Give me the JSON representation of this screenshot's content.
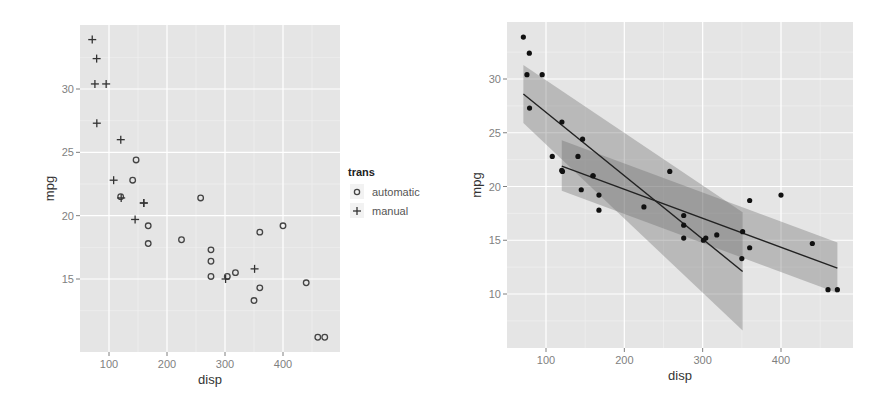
{
  "chart_data": [
    {
      "type": "scatter",
      "title": "",
      "xlabel": "disp",
      "ylabel": "mpg",
      "xlim": [
        52,
        490
      ],
      "ylim": [
        9.2,
        35.0
      ],
      "x_ticks": [
        100,
        200,
        300,
        400
      ],
      "y_ticks": [
        15,
        20,
        25,
        30
      ],
      "grid": true,
      "legend": {
        "title": "trans",
        "position": "right",
        "entries": [
          {
            "label": "automatic",
            "shape": "circle-open"
          },
          {
            "label": "manual",
            "shape": "plus"
          }
        ]
      },
      "series": [
        {
          "name": "automatic",
          "shape": "circle-open",
          "points": [
            [
              258,
              21.4
            ],
            [
              360,
              18.7
            ],
            [
              225,
              18.1
            ],
            [
              360,
              14.3
            ],
            [
              146.7,
              24.4
            ],
            [
              140.8,
              22.8
            ],
            [
              167.6,
              19.2
            ],
            [
              167.6,
              17.8
            ],
            [
              275.8,
              16.4
            ],
            [
              275.8,
              17.3
            ],
            [
              275.8,
              15.2
            ],
            [
              472,
              10.4
            ],
            [
              460,
              10.4
            ],
            [
              440,
              14.7
            ],
            [
              120.1,
              21.5
            ],
            [
              318,
              15.5
            ],
            [
              304,
              15.2
            ],
            [
              350,
              13.3
            ],
            [
              400,
              19.2
            ]
          ]
        },
        {
          "name": "manual",
          "shape": "plus",
          "points": [
            [
              160,
              21.0
            ],
            [
              160,
              21.0
            ],
            [
              108,
              22.8
            ],
            [
              78.7,
              32.4
            ],
            [
              75.7,
              30.4
            ],
            [
              71.1,
              33.9
            ],
            [
              79,
              27.3
            ],
            [
              120.3,
              26.0
            ],
            [
              95.1,
              30.4
            ],
            [
              351,
              15.8
            ],
            [
              145,
              19.7
            ],
            [
              301,
              15.0
            ],
            [
              121,
              21.4
            ]
          ]
        }
      ]
    },
    {
      "type": "scatter",
      "title": "",
      "xlabel": "disp",
      "ylabel": "mpg",
      "xlim": [
        52,
        490
      ],
      "ylim": [
        4.8,
        35.0
      ],
      "x_ticks": [
        100,
        200,
        300,
        400
      ],
      "y_ticks": [
        10,
        15,
        20,
        25,
        30
      ],
      "grid": true,
      "points": [
        [
          160,
          21.0
        ],
        [
          160,
          21.0
        ],
        [
          108,
          22.8
        ],
        [
          258,
          21.4
        ],
        [
          360,
          18.7
        ],
        [
          225,
          18.1
        ],
        [
          360,
          14.3
        ],
        [
          146.7,
          24.4
        ],
        [
          140.8,
          22.8
        ],
        [
          167.6,
          19.2
        ],
        [
          167.6,
          17.8
        ],
        [
          275.8,
          16.4
        ],
        [
          275.8,
          17.3
        ],
        [
          275.8,
          15.2
        ],
        [
          472,
          10.4
        ],
        [
          460,
          10.4
        ],
        [
          440,
          14.7
        ],
        [
          78.7,
          32.4
        ],
        [
          75.7,
          30.4
        ],
        [
          71.1,
          33.9
        ],
        [
          120.1,
          21.5
        ],
        [
          318,
          15.5
        ],
        [
          304,
          15.2
        ],
        [
          350,
          13.3
        ],
        [
          400,
          19.2
        ],
        [
          79,
          27.3
        ],
        [
          120.3,
          26.0
        ],
        [
          95.1,
          30.4
        ],
        [
          351,
          15.8
        ],
        [
          145,
          19.7
        ],
        [
          301,
          15.0
        ],
        [
          121,
          21.4
        ]
      ],
      "smooth": [
        {
          "name": "manual",
          "method": "lm",
          "line": [
            [
              71.1,
              28.6
            ],
            [
              351,
              12.1
            ]
          ],
          "ribbon": [
            [
              71.1,
              31.3,
              25.9
            ],
            [
              351,
              17.6,
              6.6
            ]
          ]
        },
        {
          "name": "automatic",
          "method": "lm",
          "line": [
            [
              120.1,
              21.9
            ],
            [
              472,
              12.4
            ]
          ],
          "ribbon": [
            [
              120.1,
              24.3,
              19.6
            ],
            [
              472,
              14.8,
              10.1
            ]
          ]
        }
      ]
    }
  ]
}
